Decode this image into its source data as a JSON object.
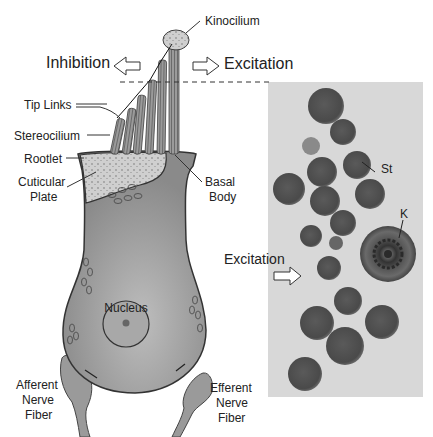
{
  "figure": {
    "type": "hair-cell-diagram-with-micrograph",
    "direction_labels": {
      "inhibition": "Inhibition",
      "excitation_top": "Excitation",
      "excitation_side": "Excitation"
    },
    "cell_labels": {
      "kinocilium": "Kinocilium",
      "tip_links": "Tip Links",
      "stereocilium": "Stereocilium",
      "rootlet": "Rootlet",
      "cuticular_plate_line1": "Cuticular",
      "cuticular_plate_line2": "Plate",
      "basal_body_line1": "Basal",
      "basal_body_line2": "Body",
      "nucleus": "Nucleus",
      "afferent_line1": "Afferent",
      "afferent_line2": "Nerve",
      "afferent_line3": "Fiber",
      "efferent_line1": "Efferent",
      "efferent_line2": "Nerve",
      "efferent_line3": "Fiber"
    },
    "micrograph_labels": {
      "stereocilium_abbrev": "St",
      "kinocilium_abbrev": "K"
    },
    "colors": {
      "cell_body": "#8f8f8f",
      "cuticular_plate": "#c8c8c8",
      "outline": "#333333",
      "micrograph_bg": "#d6d6d6",
      "micrograph_profile": "#555555"
    }
  }
}
